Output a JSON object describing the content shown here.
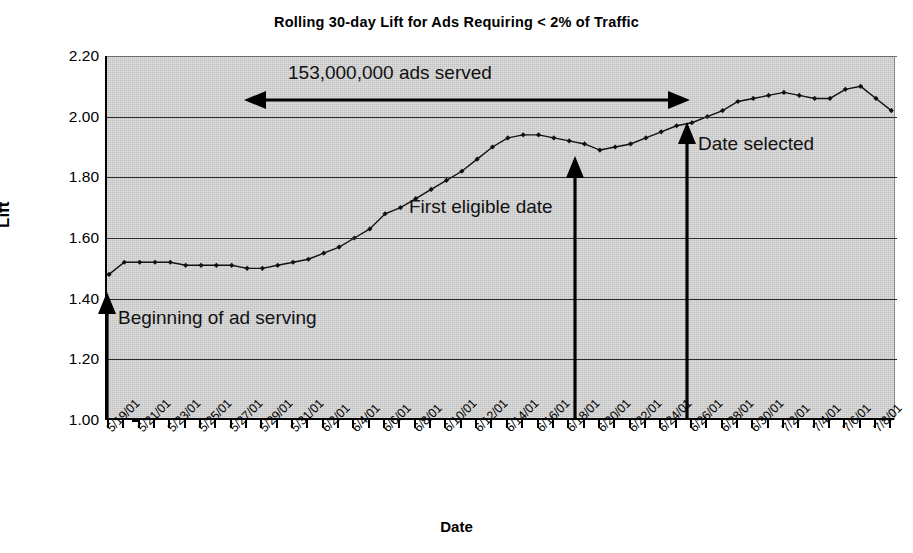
{
  "chart_data": {
    "type": "line",
    "title": "Rolling 30-day Lift for Ads Requiring < 2% of Traffic",
    "xlabel": "Date",
    "ylabel": "Lift",
    "ylim": [
      1.0,
      2.2
    ],
    "ytick_labels": [
      "2.20",
      "2.00",
      "1.80",
      "1.60",
      "1.40",
      "1.20",
      "1.00"
    ],
    "ytick_values": [
      2.2,
      2.0,
      1.8,
      1.6,
      1.4,
      1.2,
      1.0
    ],
    "grid": true,
    "legend": "none",
    "xtick_labels": [
      "5/19/01",
      "5/21/01",
      "5/23/01",
      "5/25/01",
      "5/27/01",
      "5/29/01",
      "5/31/01",
      "6/2/01",
      "6/4/01",
      "6/6/01",
      "6/8/01",
      "6/10/01",
      "6/12/01",
      "6/14/01",
      "6/16/01",
      "6/18/01",
      "6/20/01",
      "6/22/01",
      "6/24/01",
      "6/26/01",
      "6/28/01",
      "6/30/01",
      "7/2/01",
      "7/4/01",
      "7/6/01",
      "7/8/01"
    ],
    "x": [
      "5/19/01",
      "5/20/01",
      "5/21/01",
      "5/22/01",
      "5/23/01",
      "5/24/01",
      "5/25/01",
      "5/26/01",
      "5/27/01",
      "5/28/01",
      "5/29/01",
      "5/30/01",
      "5/31/01",
      "6/1/01",
      "6/2/01",
      "6/3/01",
      "6/4/01",
      "6/5/01",
      "6/6/01",
      "6/7/01",
      "6/8/01",
      "6/9/01",
      "6/10/01",
      "6/11/01",
      "6/12/01",
      "6/13/01",
      "6/14/01",
      "6/15/01",
      "6/16/01",
      "6/17/01",
      "6/18/01",
      "6/19/01",
      "6/20/01",
      "6/21/01",
      "6/22/01",
      "6/23/01",
      "6/24/01",
      "6/25/01",
      "6/26/01",
      "6/27/01",
      "6/28/01",
      "6/29/01",
      "6/30/01",
      "7/1/01",
      "7/2/01",
      "7/3/01",
      "7/4/01",
      "7/5/01",
      "7/6/01",
      "7/7/01",
      "7/8/01",
      "7/9/01"
    ],
    "values": [
      1.48,
      1.52,
      1.52,
      1.52,
      1.52,
      1.51,
      1.51,
      1.51,
      1.51,
      1.5,
      1.5,
      1.51,
      1.52,
      1.53,
      1.55,
      1.57,
      1.6,
      1.63,
      1.68,
      1.7,
      1.73,
      1.76,
      1.79,
      1.82,
      1.86,
      1.9,
      1.93,
      1.94,
      1.94,
      1.93,
      1.92,
      1.91,
      1.89,
      1.9,
      1.91,
      1.93,
      1.95,
      1.97,
      1.98,
      2.0,
      2.02,
      2.05,
      2.06,
      2.07,
      2.08,
      2.07,
      2.06,
      2.06,
      2.09,
      2.1,
      2.06,
      2.02
    ]
  },
  "annotations": {
    "ads_served": "153,000,000 ads served",
    "first_eligible": "First eligible date",
    "date_selected": "Date selected",
    "beginning": "Beginning of ad serving"
  },
  "colors": {
    "plot_background": "#c2c2c2",
    "series": "#111111",
    "gridline": "#2c2c2c",
    "axis": "#000000",
    "page_background": "#ffffff"
  }
}
